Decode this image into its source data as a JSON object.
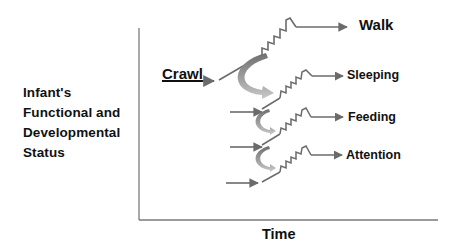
{
  "diagram": {
    "y_axis_label": [
      "Infant's",
      "Functional and",
      "Developmental",
      "Status"
    ],
    "x_axis_label": "Time",
    "start_stage": "Crawl",
    "outcomes": [
      {
        "label": "Walk"
      },
      {
        "label": "Sleeping"
      },
      {
        "label": "Feeding"
      },
      {
        "label": "Attention"
      }
    ],
    "colors": {
      "line": "#6b6b6b",
      "axis": "#7a7a7a",
      "curved_arrow_dark": "#7d7d7d",
      "curved_arrow_light": "#c4c4c4",
      "text": "#111111"
    }
  }
}
